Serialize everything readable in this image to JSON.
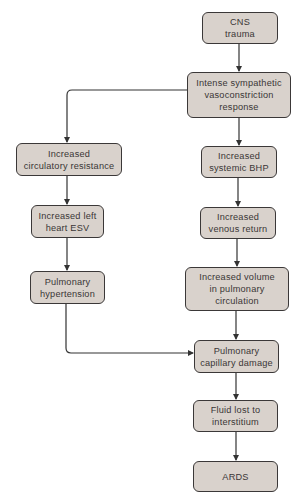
{
  "diagram": {
    "type": "flowchart",
    "colors": {
      "node_fill": "#d9d2cc",
      "node_border": "#3b3838",
      "edge": "#333333",
      "text": "#3a3636"
    },
    "nodes": [
      {
        "id": "cns",
        "label": "CNS\ntrauma",
        "x": 202,
        "y": 12,
        "w": 76,
        "h": 32
      },
      {
        "id": "sympathetic",
        "label": "Intense sympathetic\nvasoconstriction\nresponse",
        "x": 187,
        "y": 72,
        "w": 104,
        "h": 46
      },
      {
        "id": "circ_resistance",
        "label": "Increased\ncirculatory resistance",
        "x": 16,
        "y": 143,
        "w": 106,
        "h": 33
      },
      {
        "id": "systemic_bhp",
        "label": "Increased\nsystemic BHP",
        "x": 201,
        "y": 146,
        "w": 76,
        "h": 32
      },
      {
        "id": "left_esv",
        "label": "Increased left\nheart ESV",
        "x": 31,
        "y": 205,
        "w": 73,
        "h": 33
      },
      {
        "id": "venous_return",
        "label": "Increased\nvenous return",
        "x": 200,
        "y": 207,
        "w": 76,
        "h": 32
      },
      {
        "id": "pulm_htn",
        "label": "Pulmonary\nhypertension",
        "x": 30,
        "y": 271,
        "w": 75,
        "h": 33
      },
      {
        "id": "pulm_volume",
        "label": "Increased volume\nin pulmonary\ncirculation",
        "x": 185,
        "y": 267,
        "w": 104,
        "h": 44
      },
      {
        "id": "capillary_damage",
        "label": "Pulmonary\ncapillary damage",
        "x": 194,
        "y": 340,
        "w": 85,
        "h": 33
      },
      {
        "id": "fluid_lost",
        "label": "Fluid lost to\ninterstitium",
        "x": 193,
        "y": 400,
        "w": 85,
        "h": 32
      },
      {
        "id": "ards",
        "label": "ARDS",
        "x": 193,
        "y": 461,
        "w": 85,
        "h": 31
      }
    ],
    "edges": [
      {
        "from": "cns",
        "to": "sympathetic"
      },
      {
        "from": "sympathetic",
        "to": "circ_resistance"
      },
      {
        "from": "sympathetic",
        "to": "systemic_bhp"
      },
      {
        "from": "circ_resistance",
        "to": "left_esv"
      },
      {
        "from": "left_esv",
        "to": "pulm_htn"
      },
      {
        "from": "systemic_bhp",
        "to": "venous_return"
      },
      {
        "from": "venous_return",
        "to": "pulm_volume"
      },
      {
        "from": "pulm_volume",
        "to": "capillary_damage"
      },
      {
        "from": "pulm_htn",
        "to": "capillary_damage"
      },
      {
        "from": "capillary_damage",
        "to": "fluid_lost"
      },
      {
        "from": "fluid_lost",
        "to": "ards"
      }
    ]
  }
}
